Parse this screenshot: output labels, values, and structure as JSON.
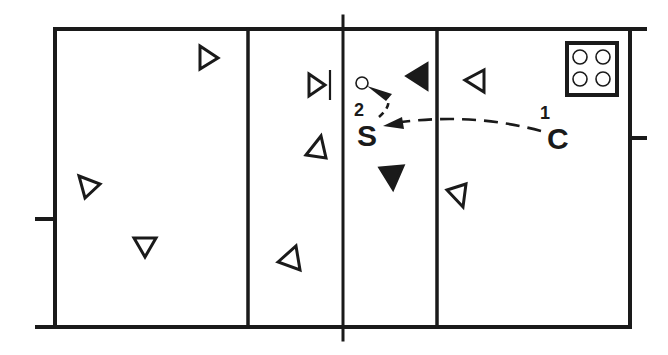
{
  "diagram": {
    "type": "volleyball-court-drill",
    "colors": {
      "line": "#1a1a1a",
      "background": "#ffffff"
    },
    "court": {
      "outer": {
        "left": 55,
        "top": 29,
        "right": 630,
        "bottom": 327
      },
      "net_x": 343,
      "attack_lines_x": [
        248,
        437
      ],
      "side_ticks": [
        {
          "side": "left",
          "y": 219
        },
        {
          "side": "right",
          "y": 138
        }
      ]
    },
    "ball_cart": {
      "icon": "ball-cart-icon",
      "balls": 4
    },
    "players": [
      {
        "id": "p1",
        "side": "left",
        "filled": false,
        "direction": "right",
        "x": 207,
        "y": 58
      },
      {
        "id": "p2",
        "side": "left",
        "filled": false,
        "direction": "right",
        "x": 316,
        "y": 85,
        "blocking": true
      },
      {
        "id": "p3",
        "side": "left",
        "filled": false,
        "direction": "up",
        "x": 318,
        "y": 148
      },
      {
        "id": "p4",
        "side": "left",
        "filled": false,
        "direction": "down",
        "x": 88,
        "y": 187
      },
      {
        "id": "p5",
        "side": "left",
        "filled": false,
        "direction": "down",
        "x": 146,
        "y": 247
      },
      {
        "id": "p6",
        "side": "left",
        "filled": false,
        "direction": "left",
        "x": 290,
        "y": 259
      },
      {
        "id": "p7",
        "side": "right",
        "filled": true,
        "direction": "left",
        "x": 419,
        "y": 75
      },
      {
        "id": "p8",
        "side": "right",
        "filled": false,
        "direction": "left",
        "x": 478,
        "y": 78
      },
      {
        "id": "p9",
        "side": "right",
        "filled": true,
        "direction": "down",
        "x": 393,
        "y": 178
      },
      {
        "id": "p10",
        "side": "right",
        "filled": false,
        "direction": "left",
        "x": 458,
        "y": 194
      }
    ],
    "labels": {
      "setter": "S",
      "coach": "C",
      "step1": "1",
      "step2": "2"
    },
    "legend_steps": [
      {
        "number": "1",
        "from": "C",
        "to": "S",
        "style": "dashed-arrow"
      },
      {
        "number": "2",
        "from": "S",
        "to": "ball",
        "style": "dashed-arrow"
      }
    ]
  }
}
